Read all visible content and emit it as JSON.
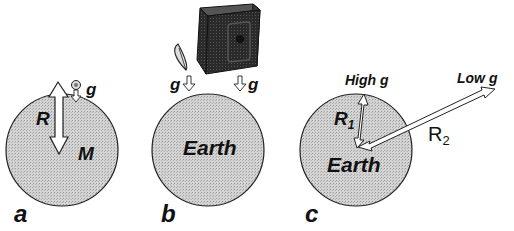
{
  "panels": [
    {
      "id": "a",
      "panel_label": "a",
      "labels": {
        "radius": "R",
        "mass": "M",
        "gravity": "g"
      },
      "colors": {
        "body_fill": "#cfcfcf",
        "outline": "#222222"
      }
    },
    {
      "id": "b",
      "panel_label": "b",
      "labels": {
        "body": "Earth",
        "gravity_left": "g",
        "gravity_right": "g"
      },
      "objects": [
        "feather",
        "safe"
      ]
    },
    {
      "id": "c",
      "panel_label": "c",
      "labels": {
        "body": "Earth",
        "r1_main": "R",
        "r1_sub": "1",
        "r2_main": "R",
        "r2_sub": "2",
        "high_g": "High g",
        "low_g": "Low g"
      }
    }
  ]
}
